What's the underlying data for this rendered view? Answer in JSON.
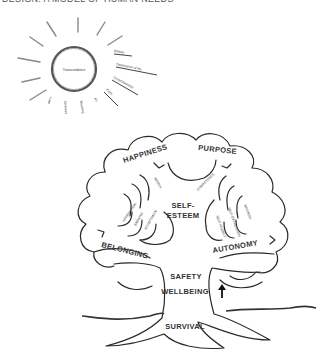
{
  "header": {
    "title": "DESIGN: A MODEL OF HUMAN NEEDS"
  },
  "sun": {
    "center_label": "Transcendence",
    "rays": [
      "Beauty",
      "Celebration of life",
      "Consciousness",
      "Faith",
      "Art",
      "Meaning",
      "Oneness",
      "Love"
    ]
  },
  "tree": {
    "crown_top": [
      "HAPPINESS",
      "PURPOSE"
    ],
    "crown_center": [
      "SELF-",
      "ESTEEM"
    ],
    "crown_sides": {
      "left": "BELONGING",
      "right": "AUTONOMY"
    },
    "branches_top": {
      "left": "WORTH",
      "right": "COMPETENCE"
    },
    "branches_left": [
      "AFFIRMATION",
      "EMPATHY",
      "ACCEPTANCE"
    ],
    "branches_right": [
      "MASTERY",
      "SELF-EXPRESSION",
      "SELF-AGENCY"
    ],
    "trunk": [
      "SAFETY",
      "WELLBEING"
    ],
    "roots": "SURVIVAL",
    "arrow_icon": "up-arrow"
  }
}
